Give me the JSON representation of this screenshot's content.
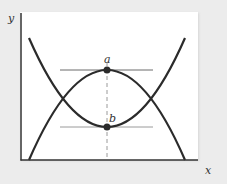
{
  "diagram": {
    "title": "",
    "axes": {
      "x_label": "x",
      "y_label": "y"
    },
    "points": [
      {
        "id": "a",
        "label": "a",
        "description": "maximum of downward-opening parabola"
      },
      {
        "id": "b",
        "label": "b",
        "description": "minimum of upward-opening parabola"
      }
    ],
    "curves": [
      {
        "id": "upward-parabola",
        "description": "U-shaped curve with minimum at b"
      },
      {
        "id": "downward-parabola",
        "description": "inverted U-shaped curve with maximum at a"
      }
    ],
    "guides": [
      {
        "id": "tangent-a",
        "style": "solid",
        "description": "horizontal line through a"
      },
      {
        "id": "tangent-b",
        "style": "solid",
        "description": "horizontal line through b"
      },
      {
        "id": "vertical-ab",
        "style": "dashed",
        "description": "vertical dashed line through a and b"
      }
    ],
    "colors": {
      "curve": "#2b2b2b",
      "guide": "#8a8a8a",
      "background": "#ececec",
      "panel": "#ffffff"
    }
  }
}
